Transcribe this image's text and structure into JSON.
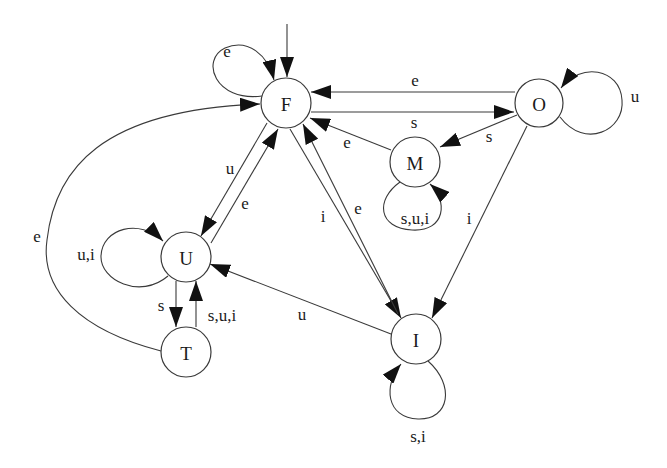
{
  "diagram": {
    "title": "",
    "type": "state-transition-diagram",
    "start_state": "F",
    "states": [
      {
        "id": "F",
        "label": "F"
      },
      {
        "id": "O",
        "label": "O"
      },
      {
        "id": "M",
        "label": "M"
      },
      {
        "id": "U",
        "label": "U"
      },
      {
        "id": "T",
        "label": "T"
      },
      {
        "id": "I",
        "label": "I"
      }
    ],
    "transitions": [
      {
        "from": "F",
        "to": "F",
        "label": "e"
      },
      {
        "from": "O",
        "to": "F",
        "label": "e"
      },
      {
        "from": "F",
        "to": "O",
        "label": "s"
      },
      {
        "from": "O",
        "to": "O",
        "label": "u"
      },
      {
        "from": "O",
        "to": "M",
        "label": "s"
      },
      {
        "from": "M",
        "to": "F",
        "label": "e"
      },
      {
        "from": "M",
        "to": "M",
        "label": "s,u,i"
      },
      {
        "from": "O",
        "to": "I",
        "label": "i"
      },
      {
        "from": "F",
        "to": "U",
        "label": "u"
      },
      {
        "from": "U",
        "to": "F",
        "label": "e"
      },
      {
        "from": "F",
        "to": "I",
        "label": "i"
      },
      {
        "from": "I",
        "to": "F",
        "label": "e"
      },
      {
        "from": "U",
        "to": "U",
        "label": "u,i"
      },
      {
        "from": "U",
        "to": "T",
        "label": "s"
      },
      {
        "from": "T",
        "to": "U",
        "label": "s,u,i"
      },
      {
        "from": "T",
        "to": "F",
        "label": "e"
      },
      {
        "from": "I",
        "to": "U",
        "label": "u"
      },
      {
        "from": "I",
        "to": "I",
        "label": "s,i"
      }
    ]
  },
  "labels": {
    "F": "F",
    "O": "O",
    "M": "M",
    "U": "U",
    "T": "T",
    "I": "I",
    "F_self": "e",
    "O_to_F": "e",
    "F_to_O": "s",
    "O_self": "u",
    "O_to_M": "s",
    "M_to_F": "e",
    "M_self": "s,u,i",
    "O_to_I": "i",
    "F_to_U": "u",
    "U_to_F": "e",
    "F_to_I": "i",
    "I_to_F": "e",
    "U_self": "u,i",
    "U_to_T": "s",
    "T_to_U": "s,u,i",
    "T_to_F": "e",
    "I_to_U": "u",
    "I_self": "s,i"
  }
}
